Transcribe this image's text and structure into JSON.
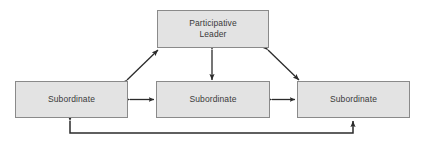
{
  "diagram": {
    "background_color": "#ffffff",
    "node_fill_color": "#e3e3e3",
    "node_border_color": "#8a8a8a",
    "node_text_color": "#3a3a3a",
    "arrow_color": "#2b2b2b",
    "nodes": [
      {
        "id": "leader",
        "label": "Participative\nLeader",
        "role": "leader",
        "x": 157,
        "y": 10,
        "width": 112,
        "height": 38
      },
      {
        "id": "sub-left",
        "label": "Subordinate",
        "role": "subordinate",
        "x": 15,
        "y": 81,
        "width": 113,
        "height": 37
      },
      {
        "id": "sub-middle",
        "label": "Subordinate",
        "role": "subordinate",
        "x": 156,
        "y": 81,
        "width": 114,
        "height": 37
      },
      {
        "id": "sub-right",
        "label": "Subordinate",
        "role": "subordinate",
        "x": 297,
        "y": 81,
        "width": 113,
        "height": 37
      }
    ],
    "connections": [
      {
        "id": "leader-to-left",
        "from": "sub-left",
        "to": "leader",
        "style": "diagonal",
        "arrowheads": "both"
      },
      {
        "id": "leader-to-middle",
        "from": "sub-middle",
        "to": "leader",
        "style": "vertical",
        "arrowheads": "both"
      },
      {
        "id": "leader-to-right",
        "from": "sub-right",
        "to": "leader",
        "style": "diagonal",
        "arrowheads": "both"
      },
      {
        "id": "left-to-middle",
        "from": "sub-left",
        "to": "sub-middle",
        "style": "horizontal",
        "arrowheads": "both"
      },
      {
        "id": "middle-to-right",
        "from": "sub-middle",
        "to": "sub-right",
        "style": "horizontal",
        "arrowheads": "both"
      },
      {
        "id": "left-to-right-bypass",
        "from": "sub-left",
        "to": "sub-right",
        "style": "elbow-below",
        "arrowheads": "both"
      }
    ]
  }
}
